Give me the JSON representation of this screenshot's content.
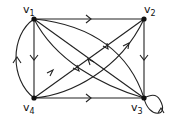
{
  "graph": {
    "nodes": [
      {
        "id": "v1",
        "label": "v",
        "sub": "1",
        "x": 34,
        "y": 19
      },
      {
        "id": "v2",
        "label": "v",
        "sub": "2",
        "x": 144,
        "y": 19
      },
      {
        "id": "v3",
        "label": "v",
        "sub": "3",
        "x": 144,
        "y": 98
      },
      {
        "id": "v4",
        "label": "v",
        "sub": "4",
        "x": 34,
        "y": 98
      }
    ],
    "edges": [
      {
        "from": "v1",
        "to": "v2",
        "shape": "straight"
      },
      {
        "from": "v2",
        "to": "v3",
        "shape": "straight"
      },
      {
        "from": "v1",
        "to": "v4",
        "shape": "straight"
      },
      {
        "from": "v4",
        "to": "v1",
        "shape": "curved"
      },
      {
        "from": "v4",
        "to": "v3",
        "shape": "straight"
      },
      {
        "from": "v1",
        "to": "v3",
        "shape": "straight"
      },
      {
        "from": "v3",
        "to": "v1",
        "shape": "curved"
      },
      {
        "from": "v1",
        "to": "v3",
        "shape": "curved"
      },
      {
        "from": "v4",
        "to": "v2",
        "shape": "straight"
      },
      {
        "from": "v4",
        "to": "v2",
        "shape": "curved"
      },
      {
        "from": "v3",
        "to": "v3",
        "shape": "loop"
      }
    ]
  }
}
